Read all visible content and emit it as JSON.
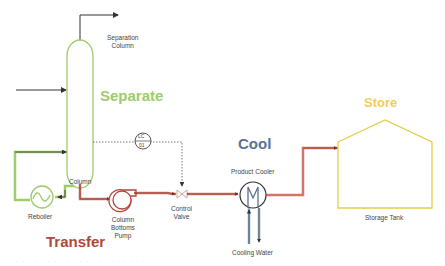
{
  "stages": {
    "separate": {
      "label": "Separate",
      "color": "#9ccc6c"
    },
    "transfer": {
      "label": "Transfer",
      "color": "#b0473a"
    },
    "cool": {
      "label": "Cool",
      "color": "#5a7196"
    },
    "store": {
      "label": "Store",
      "color": "#f0cd5a"
    }
  },
  "equipment": {
    "separation_column": {
      "label_line1": "Separation",
      "label_line2": "Column"
    },
    "column": {
      "label": "Column"
    },
    "reboiler": {
      "label": "Reboiler"
    },
    "pump": {
      "label_line1": "Column",
      "label_line2": "Bottoms",
      "label_line3": "Pump"
    },
    "control_valve": {
      "label_line1": "Control",
      "label_line2": "Valve"
    },
    "level_controller": {
      "tag_top": "LC",
      "tag_bottom": "01"
    },
    "product_cooler": {
      "label": "Product Cooler"
    },
    "cooling_water": {
      "label": "Cooling Water"
    },
    "storage_tank": {
      "label": "Storage Tank"
    }
  },
  "footer": {
    "faint_text": ". . .   . . . . . .   . . . .   . . .   . . . . . ."
  }
}
